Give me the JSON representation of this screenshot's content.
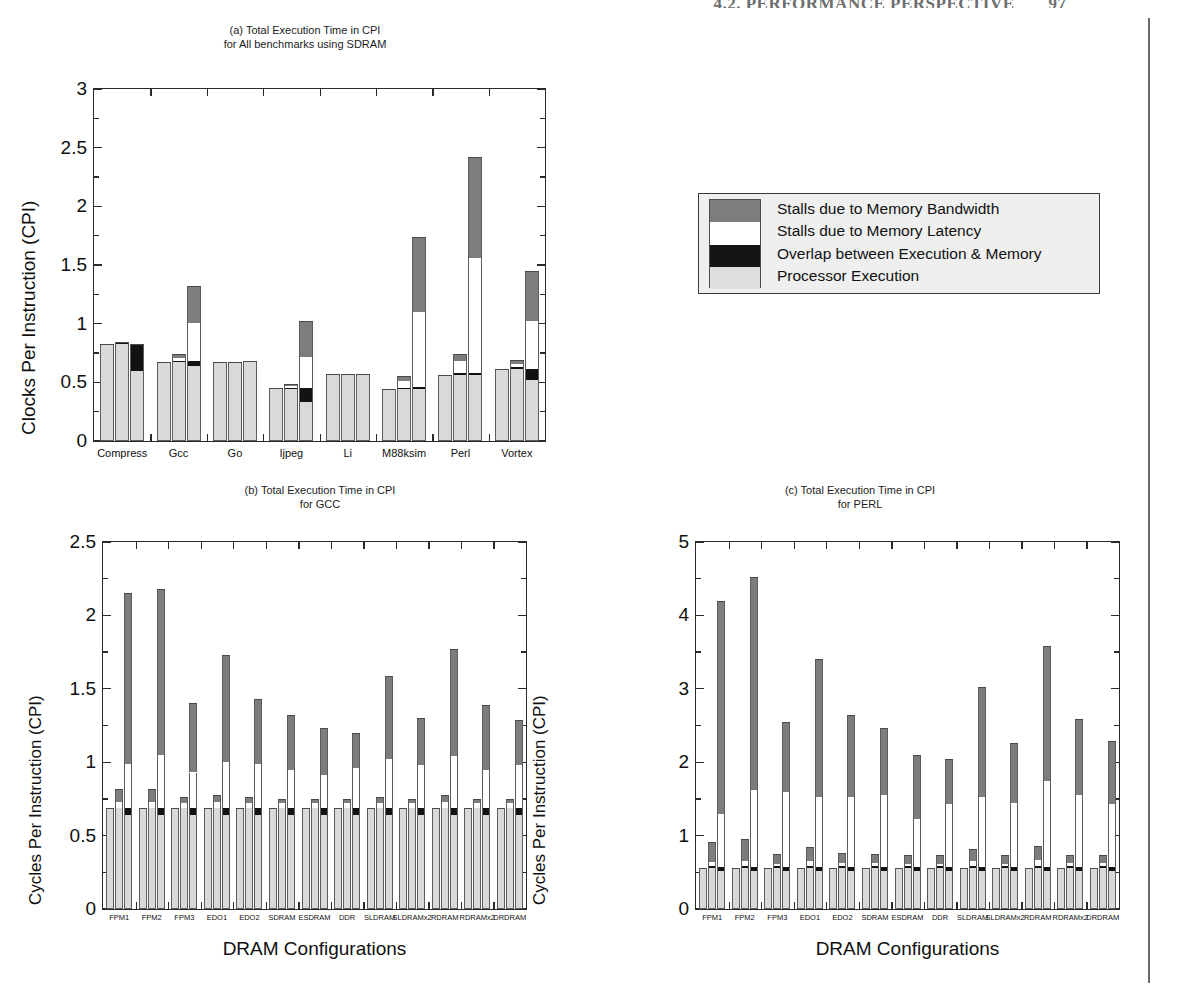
{
  "running_head": {
    "text": "4.2. PERFORMANCE PERSPECTIVE",
    "page_number": "97"
  },
  "legend": {
    "items": [
      {
        "key": "bandwidth",
        "label": "Stalls due to Memory Bandwidth",
        "color": "#7d7d7d"
      },
      {
        "key": "latency",
        "label": "Stalls due to Memory Latency",
        "color": "#ffffff"
      },
      {
        "key": "overlap",
        "label": "Overlap between Execution & Memory",
        "color": "#141414"
      },
      {
        "key": "execution",
        "label": "Processor Execution",
        "color": "#dedede"
      }
    ]
  },
  "chart_data": [
    {
      "id": "a",
      "type": "bar",
      "title": "(a) Total Execution Time in CPI\nfor All benchmarks using SDRAM",
      "xlabel": "",
      "ylabel": "Clocks Per Instruction (CPI)",
      "ylim": [
        0,
        3
      ],
      "yticks": [
        0,
        0.5,
        1,
        1.5,
        2,
        2.5,
        3
      ],
      "ytick_labels": [
        "0",
        "0.5",
        "1",
        "1.5",
        "2",
        "2.5",
        "3"
      ],
      "grid": false,
      "legend_position": "external-right",
      "categories": [
        "Compress",
        "Gcc",
        "Go",
        "Ijpeg",
        "Li",
        "M88ksim",
        "Perl",
        "Vortex"
      ],
      "bars_per_category": 3,
      "series": [
        {
          "name": "Processor Execution",
          "key": "execution",
          "values": [
            [
              0.83,
              0.83,
              0.6
            ],
            [
              0.67,
              0.67,
              0.64
            ],
            [
              0.67,
              0.67,
              0.68
            ],
            [
              0.45,
              0.44,
              0.33
            ],
            [
              0.57,
              0.57,
              0.57
            ],
            [
              0.44,
              0.44,
              0.44
            ],
            [
              0.56,
              0.56,
              0.56
            ],
            [
              0.61,
              0.61,
              0.52
            ]
          ]
        },
        {
          "name": "Overlap between Execution & Memory",
          "key": "overlap",
          "values": [
            [
              0,
              0.01,
              0.23
            ],
            [
              0,
              0.01,
              0.04
            ],
            [
              0,
              0,
              0
            ],
            [
              0,
              0.01,
              0.12
            ],
            [
              0,
              0,
              0
            ],
            [
              0,
              0.01,
              0.02
            ],
            [
              0,
              0.02,
              0.02
            ],
            [
              0,
              0.02,
              0.09
            ]
          ]
        },
        {
          "name": "Stalls due to Memory Latency",
          "key": "latency",
          "values": [
            [
              0,
              0,
              0
            ],
            [
              0,
              0.03,
              0.33
            ],
            [
              0,
              0,
              0
            ],
            [
              0,
              0.02,
              0.27
            ],
            [
              0,
              0,
              0
            ],
            [
              0,
              0.06,
              0.64
            ],
            [
              0,
              0.1,
              0.98
            ],
            [
              0,
              0.03,
              0.41
            ]
          ]
        },
        {
          "name": "Stalls due to Memory Bandwidth",
          "key": "bandwidth",
          "values": [
            [
              0,
              0,
              0
            ],
            [
              0,
              0.03,
              0.31
            ],
            [
              0,
              0,
              0
            ],
            [
              0,
              0.02,
              0.3
            ],
            [
              0,
              0,
              0
            ],
            [
              0,
              0.04,
              0.64
            ],
            [
              0,
              0.06,
              0.86
            ],
            [
              0,
              0.03,
              0.43
            ]
          ]
        }
      ]
    },
    {
      "id": "b",
      "type": "bar",
      "title": "(b) Total Execution Time in CPI\nfor GCC",
      "xlabel": "DRAM Configurations",
      "ylabel": "Cycles Per Instruction (CPI)",
      "ylim": [
        0,
        2.5
      ],
      "yticks": [
        0,
        0.5,
        1,
        1.5,
        2,
        2.5
      ],
      "ytick_labels": [
        "0",
        "0.5",
        "1",
        "1.5",
        "2",
        "2.5"
      ],
      "grid": false,
      "categories": [
        "FPM1",
        "FPM2",
        "FPM3",
        "EDO1",
        "EDO2",
        "SDRAM",
        "ESDRAM",
        "DDR",
        "SLDRAM",
        "SLDRAMx2",
        "RDRAM",
        "RDRAMx2",
        "DRDRAM"
      ],
      "bars_per_category": 3,
      "series": [
        {
          "name": "Processor Execution",
          "key": "execution",
          "values": [
            [
              0.69,
              0.69,
              0.64
            ],
            [
              0.69,
              0.69,
              0.64
            ],
            [
              0.69,
              0.69,
              0.64
            ],
            [
              0.69,
              0.69,
              0.64
            ],
            [
              0.69,
              0.69,
              0.64
            ],
            [
              0.69,
              0.69,
              0.64
            ],
            [
              0.69,
              0.69,
              0.64
            ],
            [
              0.69,
              0.69,
              0.64
            ],
            [
              0.69,
              0.69,
              0.64
            ],
            [
              0.69,
              0.69,
              0.64
            ],
            [
              0.69,
              0.69,
              0.64
            ],
            [
              0.69,
              0.69,
              0.64
            ],
            [
              0.69,
              0.69,
              0.64
            ]
          ]
        },
        {
          "name": "Overlap between Execution & Memory",
          "key": "overlap",
          "values": [
            [
              0,
              0.0,
              0.05
            ],
            [
              0,
              0.0,
              0.05
            ],
            [
              0,
              0.0,
              0.05
            ],
            [
              0,
              0.0,
              0.05
            ],
            [
              0,
              0.0,
              0.05
            ],
            [
              0,
              0.0,
              0.05
            ],
            [
              0,
              0.0,
              0.05
            ],
            [
              0,
              0.0,
              0.05
            ],
            [
              0,
              0.0,
              0.05
            ],
            [
              0,
              0.0,
              0.05
            ],
            [
              0,
              0.0,
              0.05
            ],
            [
              0,
              0.0,
              0.05
            ],
            [
              0,
              0.0,
              0.05
            ]
          ]
        },
        {
          "name": "Stalls due to Memory Latency",
          "key": "latency",
          "values": [
            [
              0,
              0.04,
              0.3
            ],
            [
              0,
              0.04,
              0.36
            ],
            [
              0,
              0.03,
              0.24
            ],
            [
              0,
              0.04,
              0.31
            ],
            [
              0,
              0.03,
              0.3
            ],
            [
              0,
              0.03,
              0.26
            ],
            [
              0,
              0.03,
              0.22
            ],
            [
              0,
              0.03,
              0.27
            ],
            [
              0,
              0.03,
              0.33
            ],
            [
              0,
              0.03,
              0.29
            ],
            [
              0,
              0.04,
              0.35
            ],
            [
              0,
              0.03,
              0.26
            ],
            [
              0,
              0.03,
              0.29
            ]
          ]
        },
        {
          "name": "Stalls due to Memory Bandwidth",
          "key": "bandwidth",
          "values": [
            [
              0,
              0.09,
              1.16
            ],
            [
              0,
              0.09,
              1.13
            ],
            [
              0,
              0.04,
              0.47
            ],
            [
              0,
              0.05,
              0.73
            ],
            [
              0,
              0.04,
              0.44
            ],
            [
              0,
              0.03,
              0.37
            ],
            [
              0,
              0.03,
              0.32
            ],
            [
              0,
              0.03,
              0.24
            ],
            [
              0,
              0.04,
              0.57
            ],
            [
              0,
              0.03,
              0.32
            ],
            [
              0,
              0.05,
              0.73
            ],
            [
              0,
              0.03,
              0.44
            ],
            [
              0,
              0.03,
              0.31
            ]
          ]
        }
      ],
      "totals_tall_bar": [
        2.15,
        2.18,
        1.4,
        1.73,
        1.43,
        1.32,
        1.23,
        1.2,
        1.59,
        1.29,
        1.77,
        1.38,
        1.29
      ]
    },
    {
      "id": "c",
      "type": "bar",
      "title": "(c) Total Execution Time in CPI\nfor PERL",
      "xlabel": "DRAM Configurations",
      "ylabel": "Cycles Per Instruction (CPI)",
      "ylim": [
        0,
        5
      ],
      "yticks": [
        0,
        1,
        2,
        3,
        4,
        5
      ],
      "ytick_labels": [
        "0",
        "1",
        "2",
        "3",
        "4",
        "5"
      ],
      "grid": false,
      "categories": [
        "FPM1",
        "FPM2",
        "FPM3",
        "EDO1",
        "EDO2",
        "SDRAM",
        "ESDRAM",
        "DDR",
        "SLDRAM",
        "SLDRAMx2",
        "RDRAM",
        "RDRAMx2",
        "DRDRAM"
      ],
      "bars_per_category": 3,
      "series": [
        {
          "name": "Processor Execution",
          "key": "execution",
          "values": [
            [
              0.56,
              0.56,
              0.52
            ],
            [
              0.56,
              0.56,
              0.52
            ],
            [
              0.56,
              0.56,
              0.52
            ],
            [
              0.56,
              0.56,
              0.52
            ],
            [
              0.56,
              0.56,
              0.52
            ],
            [
              0.56,
              0.56,
              0.52
            ],
            [
              0.56,
              0.56,
              0.52
            ],
            [
              0.56,
              0.56,
              0.52
            ],
            [
              0.56,
              0.56,
              0.52
            ],
            [
              0.56,
              0.56,
              0.52
            ],
            [
              0.56,
              0.56,
              0.52
            ],
            [
              0.56,
              0.56,
              0.52
            ],
            [
              0.56,
              0.56,
              0.52
            ]
          ]
        },
        {
          "name": "Overlap between Execution & Memory",
          "key": "overlap",
          "values": [
            [
              0,
              0.02,
              0.05
            ],
            [
              0,
              0.02,
              0.05
            ],
            [
              0,
              0.02,
              0.05
            ],
            [
              0,
              0.02,
              0.05
            ],
            [
              0,
              0.02,
              0.05
            ],
            [
              0,
              0.02,
              0.05
            ],
            [
              0,
              0.02,
              0.05
            ],
            [
              0,
              0.02,
              0.05
            ],
            [
              0,
              0.02,
              0.05
            ],
            [
              0,
              0.02,
              0.05
            ],
            [
              0,
              0.02,
              0.05
            ],
            [
              0,
              0.02,
              0.05
            ],
            [
              0,
              0.02,
              0.05
            ]
          ]
        },
        {
          "name": "Stalls due to Memory Latency",
          "key": "latency",
          "values": [
            [
              0,
              0.06,
              0.72
            ],
            [
              0,
              0.08,
              1.05
            ],
            [
              0,
              0.04,
              1.03
            ],
            [
              0,
              0.07,
              0.95
            ],
            [
              0,
              0.05,
              0.95
            ],
            [
              0,
              0.05,
              0.99
            ],
            [
              0,
              0.04,
              0.65
            ],
            [
              0,
              0.04,
              0.86
            ],
            [
              0,
              0.08,
              0.95
            ],
            [
              0,
              0.04,
              0.88
            ],
            [
              0,
              0.09,
              1.18
            ],
            [
              0,
              0.05,
              0.98
            ],
            [
              0,
              0.05,
              0.86
            ]
          ]
        },
        {
          "name": "Stalls due to Memory Bandwidth",
          "key": "bandwidth",
          "values": [
            [
              0,
              0.27,
              2.9
            ],
            [
              0,
              0.3,
              2.9
            ],
            [
              0,
              0.13,
              0.95
            ],
            [
              0,
              0.2,
              1.88
            ],
            [
              0,
              0.13,
              1.13
            ],
            [
              0,
              0.12,
              0.9
            ],
            [
              0,
              0.11,
              0.88
            ],
            [
              0,
              0.11,
              0.62
            ],
            [
              0,
              0.16,
              1.51
            ],
            [
              0,
              0.11,
              0.81
            ],
            [
              0,
              0.19,
              1.84
            ],
            [
              0,
              0.11,
              1.04
            ],
            [
              0,
              0.11,
              0.86
            ]
          ]
        }
      ],
      "totals_tall_bar": [
        4.18,
        4.52,
        2.54,
        3.4,
        2.64,
        2.44,
        2.1,
        2.05,
        3.03,
        2.26,
        3.55,
        2.59,
        2.29
      ]
    }
  ]
}
